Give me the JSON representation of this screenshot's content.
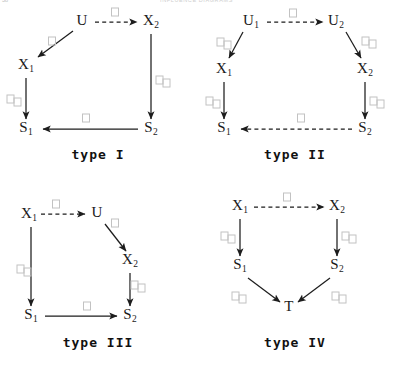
{
  "page": {
    "folio": "38",
    "running_head": "INFLUENCE DIAGRAMS"
  },
  "figure": {
    "edge_label_glyph": "missing-glyph-box",
    "node_font": "serif",
    "caption_font": "monospace"
  },
  "diagrams": [
    {
      "id": "type-I",
      "caption": "type I",
      "nodes": [
        {
          "id": "U",
          "label": "U",
          "sub": "",
          "x": 82,
          "y": 22
        },
        {
          "id": "X2",
          "label": "X",
          "sub": "2",
          "x": 151,
          "y": 22
        },
        {
          "id": "X1",
          "label": "X",
          "sub": "1",
          "x": 26,
          "y": 66
        },
        {
          "id": "S1",
          "label": "S",
          "sub": "1",
          "x": 26,
          "y": 129
        },
        {
          "id": "S2",
          "label": "S",
          "sub": "2",
          "x": 151,
          "y": 129
        }
      ],
      "edges": [
        {
          "from": "U",
          "to": "X2",
          "style": "dashed",
          "label_boxes": 1
        },
        {
          "from": "U",
          "to": "X1",
          "style": "solid",
          "label_boxes": 1
        },
        {
          "from": "X1",
          "to": "S1",
          "style": "solid",
          "label_boxes": 2
        },
        {
          "from": "X2",
          "to": "S2",
          "style": "solid",
          "label_boxes": 2
        },
        {
          "from": "S2",
          "to": "S1",
          "style": "solid",
          "label_boxes": 1
        }
      ]
    },
    {
      "id": "type-II",
      "caption": "type II",
      "nodes": [
        {
          "id": "U1",
          "label": "U",
          "sub": "1",
          "x": 54,
          "y": 22
        },
        {
          "id": "U2",
          "label": "U",
          "sub": "2",
          "x": 139,
          "y": 22
        },
        {
          "id": "X1",
          "label": "X",
          "sub": "1",
          "x": 27,
          "y": 70
        },
        {
          "id": "X2",
          "label": "X",
          "sub": "2",
          "x": 168,
          "y": 70
        },
        {
          "id": "S1",
          "label": "S",
          "sub": "1",
          "x": 27,
          "y": 129
        },
        {
          "id": "S2",
          "label": "S",
          "sub": "2",
          "x": 168,
          "y": 129
        }
      ],
      "edges": [
        {
          "from": "U1",
          "to": "U2",
          "style": "dashed",
          "label_boxes": 1
        },
        {
          "from": "U1",
          "to": "X1",
          "style": "solid",
          "label_boxes": 2
        },
        {
          "from": "U2",
          "to": "X2",
          "style": "solid",
          "label_boxes": 2
        },
        {
          "from": "X1",
          "to": "S1",
          "style": "solid",
          "label_boxes": 2
        },
        {
          "from": "X2",
          "to": "S2",
          "style": "solid",
          "label_boxes": 2
        },
        {
          "from": "S2",
          "to": "S1",
          "style": "dashed",
          "label_boxes": 1
        }
      ]
    },
    {
      "id": "type-III",
      "caption": "type III",
      "nodes": [
        {
          "id": "X1",
          "label": "X",
          "sub": "1",
          "x": 29,
          "y": 32
        },
        {
          "id": "U",
          "label": "U",
          "sub": "",
          "x": 97,
          "y": 31
        },
        {
          "id": "X2",
          "label": "X",
          "sub": "2",
          "x": 130,
          "y": 78
        },
        {
          "id": "S1",
          "label": "S",
          "sub": "1",
          "x": 31,
          "y": 133
        },
        {
          "id": "S2",
          "label": "S",
          "sub": "2",
          "x": 130,
          "y": 133
        }
      ],
      "edges": [
        {
          "from": "X1",
          "to": "U",
          "style": "dashed",
          "label_boxes": 1
        },
        {
          "from": "U",
          "to": "X2",
          "style": "solid",
          "label_boxes": 1
        },
        {
          "from": "X1",
          "to": "S1",
          "style": "solid",
          "label_boxes": 2
        },
        {
          "from": "X2",
          "to": "S2",
          "style": "solid",
          "label_boxes": 2
        },
        {
          "from": "S1",
          "to": "S2",
          "style": "solid",
          "label_boxes": 1
        }
      ]
    },
    {
      "id": "type-IV",
      "caption": "type IV",
      "nodes": [
        {
          "id": "X1",
          "label": "X",
          "sub": "1",
          "x": 43,
          "y": 24
        },
        {
          "id": "X2",
          "label": "X",
          "sub": "2",
          "x": 140,
          "y": 24
        },
        {
          "id": "S1",
          "label": "S",
          "sub": "1",
          "x": 43,
          "y": 83
        },
        {
          "id": "S2",
          "label": "S",
          "sub": "2",
          "x": 140,
          "y": 83
        },
        {
          "id": "T",
          "label": "T",
          "sub": "",
          "x": 92,
          "y": 125
        }
      ],
      "edges": [
        {
          "from": "X1",
          "to": "X2",
          "style": "dashed",
          "label_boxes": 1
        },
        {
          "from": "X1",
          "to": "S1",
          "style": "solid",
          "label_boxes": 2
        },
        {
          "from": "X2",
          "to": "S2",
          "style": "solid",
          "label_boxes": 2
        },
        {
          "from": "S1",
          "to": "T",
          "style": "solid",
          "label_boxes": 2
        },
        {
          "from": "S2",
          "to": "T",
          "style": "solid",
          "label_boxes": 2
        }
      ]
    }
  ]
}
